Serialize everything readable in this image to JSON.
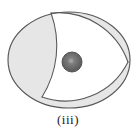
{
  "figure": {
    "caption": "(iii)",
    "kind": "geometric-diagram",
    "canvas": {
      "width": 136,
      "height": 136
    },
    "colors": {
      "background": "#ffffff",
      "outline": "#58585a",
      "lune_fill": "#e6e6e6",
      "interior_fill": "#ffffff",
      "dot_fill": "#6b6b6b",
      "dot_outline": "#4a4a4a",
      "dot_highlight": "#9a9a9a",
      "caption_color": "#1a1a1a"
    },
    "outer_ellipse": {
      "label": "outer-ellipse",
      "cx": 69,
      "cy": 60,
      "rx": 61,
      "ry": 48
    },
    "vertices": [
      {
        "label": "top-vertex",
        "x": 51,
        "y": 13
      },
      {
        "label": "right-vertex",
        "x": 128,
        "y": 62
      },
      {
        "label": "bottom-vertex",
        "x": 42,
        "y": 97
      }
    ],
    "arcs": [
      {
        "label": "arc-top-right",
        "from": "top-vertex",
        "to": "right-vertex"
      },
      {
        "label": "arc-right-bottom",
        "from": "right-vertex",
        "to": "bottom-vertex"
      },
      {
        "label": "arc-bottom-top",
        "from": "bottom-vertex",
        "to": "top-vertex"
      }
    ],
    "regions": [
      {
        "label": "lune-left",
        "fill": "#e6e6e6"
      },
      {
        "label": "lune-upper-right",
        "fill": "#e6e6e6"
      },
      {
        "label": "lune-lower-right",
        "fill": "#e6e6e6"
      },
      {
        "label": "curved-triangle-interior",
        "fill": "#ffffff"
      }
    ],
    "center_dot": {
      "label": "center-dot",
      "cx": 72,
      "cy": 62,
      "r": 10,
      "texture": "radial-hatch"
    }
  }
}
